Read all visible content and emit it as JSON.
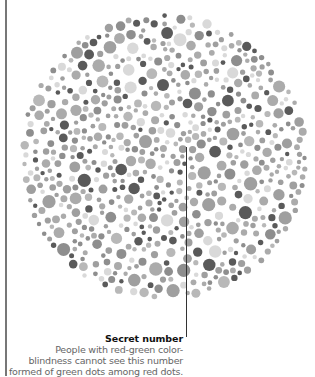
{
  "plate": {
    "center": [
      164,
      157
    ],
    "radius": 145,
    "seed": 20240611,
    "dot_colors": [
      "#5a5a5a",
      "#8e8e8e",
      "#9f9f9f",
      "#ababab",
      "#b8b8b8",
      "#d9d9d9"
    ],
    "dot_color_weights": [
      0.14,
      0.14,
      0.22,
      0.22,
      0.14,
      0.14
    ],
    "dot_radius_range": [
      2.2,
      6.8
    ],
    "attempts": 9000
  },
  "caption": {
    "title": "Secret number",
    "lines": [
      "People with red-green color-",
      "blindness cannot see this number",
      "formed of green dots among red dots."
    ]
  }
}
